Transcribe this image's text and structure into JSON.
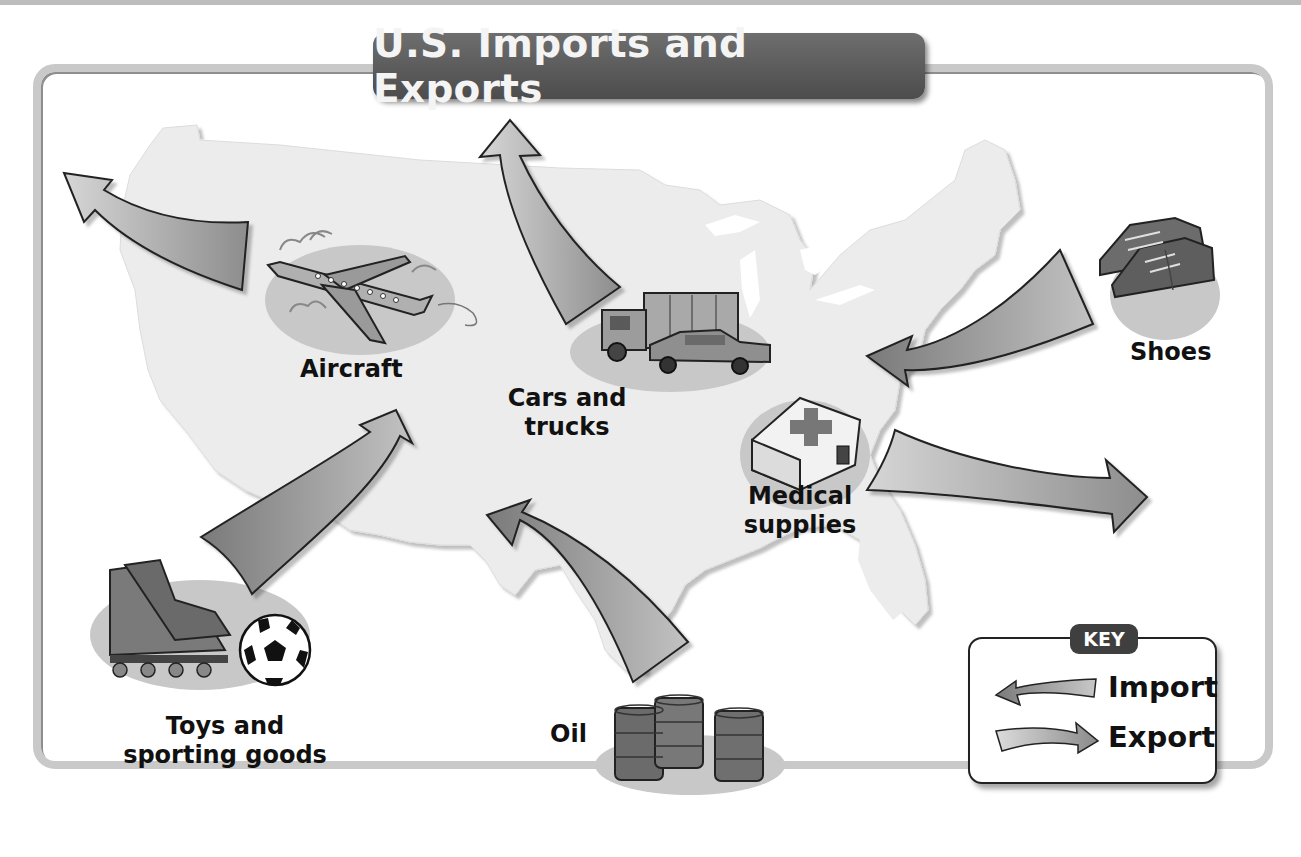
{
  "title": "U.S. Imports and Exports",
  "colors": {
    "import_arrow": "#8a8a8a",
    "export_arrow": "#c4c4c4",
    "map_fill": "#ececec",
    "title_banner": "#595959",
    "frame": "#c9c9c9"
  },
  "goods": [
    {
      "id": "aircraft",
      "label": "Aircraft",
      "flow": "export",
      "icon": "airplane-icon"
    },
    {
      "id": "cars",
      "label_line1": "Cars and",
      "label_line2": "trucks",
      "flow": "export",
      "icon": "truck-car-icon"
    },
    {
      "id": "shoes",
      "label": "Shoes",
      "flow": "import",
      "icon": "shoes-icon"
    },
    {
      "id": "medical",
      "label_line1": "Medical",
      "label_line2": "supplies",
      "flow": "export",
      "icon": "first-aid-kit-icon"
    },
    {
      "id": "toys",
      "label_line1": "Toys and",
      "label_line2": "sporting goods",
      "flow": "import",
      "icon": "skates-soccer-ball-icon"
    },
    {
      "id": "oil",
      "label": "Oil",
      "flow": "import",
      "icon": "oil-barrels-icon"
    }
  ],
  "key": {
    "badge": "KEY",
    "import_label": "Import",
    "export_label": "Export"
  }
}
